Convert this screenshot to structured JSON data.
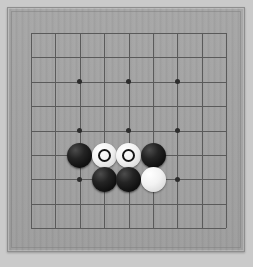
{
  "app": {
    "title": "Go Board",
    "canvas_width": 253,
    "canvas_height": 267,
    "page_background": "#cacaca"
  },
  "board": {
    "name": "goban",
    "size": 9,
    "board_color": "#a2a2a2",
    "line_color": "#5a5a5a",
    "star_point_color": "#2c2c2c",
    "frame_color": "#8e8e8e",
    "origin_x": 23,
    "origin_y": 25,
    "cell_size": 24.4,
    "grid_lines_count": 9
  },
  "star_points": [
    {
      "label": "star-3-3",
      "col": 2,
      "row": 2
    },
    {
      "label": "star-5-3",
      "col": 4,
      "row": 2
    },
    {
      "label": "star-7-3",
      "col": 6,
      "row": 2
    },
    {
      "label": "star-3-5",
      "col": 2,
      "row": 4
    },
    {
      "label": "star-5-5",
      "col": 4,
      "row": 4
    },
    {
      "label": "star-7-5",
      "col": 6,
      "row": 4
    },
    {
      "label": "star-3-7",
      "col": 2,
      "row": 6
    },
    {
      "label": "star-7-7",
      "col": 6,
      "row": 6
    }
  ],
  "stones": [
    {
      "id": "stone-b-c2r5",
      "color": "black",
      "col": 2,
      "row": 5,
      "marked": false,
      "label": "Black"
    },
    {
      "id": "stone-w-c3r5",
      "color": "white",
      "col": 3,
      "row": 5,
      "marked": true,
      "label": "White marked"
    },
    {
      "id": "stone-w-c4r5",
      "color": "white",
      "col": 4,
      "row": 5,
      "marked": true,
      "label": "White marked"
    },
    {
      "id": "stone-b-c5r5",
      "color": "black",
      "col": 5,
      "row": 5,
      "marked": false,
      "label": "Black"
    },
    {
      "id": "stone-b-c3r6",
      "color": "black",
      "col": 3,
      "row": 6,
      "marked": false,
      "label": "Black"
    },
    {
      "id": "stone-b-c4r6",
      "color": "black",
      "col": 4,
      "row": 6,
      "marked": false,
      "label": "Black"
    },
    {
      "id": "stone-w-c5r6",
      "color": "white",
      "col": 5,
      "row": 6,
      "marked": false,
      "label": "White"
    }
  ],
  "legend": {
    "black_label": "Black stone",
    "white_label": "White stone",
    "marked_label": "Marked stone"
  }
}
